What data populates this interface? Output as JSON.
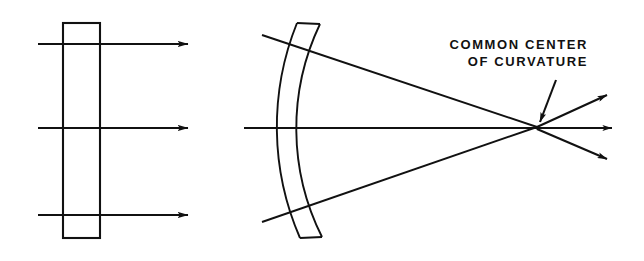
{
  "figure": {
    "name": "concentric-meniscus-lens-diagram",
    "background_color": "#ffffff",
    "stroke_color": "#111111",
    "width": 644,
    "height": 261,
    "annotations": {
      "common_center": {
        "line1": "COMMON CENTER",
        "line2": "OF CURVATURE",
        "full_text": "COMMON CENTER OF CURVATURE",
        "pointer": "leader-arrow-down-left"
      }
    },
    "left_element": {
      "name": "plane-parallel-plate",
      "shape": "rectangle",
      "x": 63,
      "y": 23,
      "width": 37,
      "height": 215,
      "ray_count": 3,
      "ray_direction": "left-to-right",
      "ray_y_positions": [
        44,
        128,
        215
      ],
      "ray_start_x": 38,
      "ray_end_x": 188,
      "ray_label": "parallel-rays"
    },
    "right_element": {
      "name": "concentric-meniscus-lens",
      "shape": "meniscus",
      "front_surface_radius": 278,
      "back_surface_radius": 242,
      "axis_y": 128,
      "axis_start_x": 244,
      "axis_end_x": 612,
      "center_of_curvature_x": 537,
      "center_of_curvature_y": 127,
      "converging_ray_count": 2,
      "converging_ray_start": [
        [
          262,
          35
        ],
        [
          262,
          222
        ]
      ],
      "diverging_ray_count": 3,
      "diverging_ray_angles_deg": [
        -25,
        0,
        25
      ],
      "diverging_ray_end_x": 612
    }
  }
}
